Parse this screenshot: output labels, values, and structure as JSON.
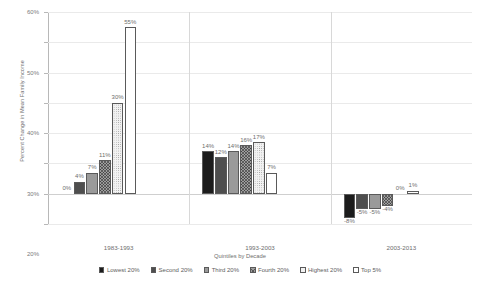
{
  "chart_data": {
    "type": "bar",
    "title": "",
    "xlabel": "Quintiles by Decade",
    "ylabel": "Percent Change in Mean Family Income",
    "ylim": [
      -10,
      60
    ],
    "ytick_labels": [
      "60%",
      "50%",
      "40%",
      "30%",
      "20%",
      "10%",
      "0%",
      "-10%"
    ],
    "ytick_values": [
      60,
      50,
      40,
      30,
      20,
      10,
      0,
      -10
    ],
    "grid": true,
    "legend_position": "bottom",
    "categories": [
      "1983-1993",
      "1993-2003",
      "2003-2013"
    ],
    "series": [
      {
        "name": "Lowest 20%",
        "pattern": "p-solid-dark",
        "values": [
          0,
          14,
          -8
        ],
        "labels": [
          "0%",
          "14%",
          "-8%"
        ]
      },
      {
        "name": "Second 20%",
        "pattern": "p-dark-gray",
        "values": [
          4,
          12,
          -5
        ],
        "labels": [
          "4%",
          "12%",
          "-5%"
        ]
      },
      {
        "name": "Third 20%",
        "pattern": "p-mid-gray",
        "values": [
          7,
          14,
          -5
        ],
        "labels": [
          "7%",
          "14%",
          "-5%"
        ]
      },
      {
        "name": "Fourth 20%",
        "pattern": "p-hatch",
        "values": [
          11,
          16,
          -4
        ],
        "labels": [
          "11%",
          "16%",
          "-4%"
        ]
      },
      {
        "name": "Highest 20%",
        "pattern": "p-dots",
        "values": [
          30,
          17,
          0
        ],
        "labels": [
          "30%",
          "17%",
          "0%"
        ]
      },
      {
        "name": "Top 5%",
        "pattern": "p-white",
        "values": [
          55,
          7,
          1
        ],
        "labels": [
          "55%",
          "7%",
          "1%"
        ]
      }
    ]
  },
  "axis": {
    "y_title": "Percent Change in Mean Family Income",
    "x_title": "Quintiles by Decade"
  },
  "colors": {
    "gridline": "#eaeaea",
    "axis": "#b8b8b8",
    "text": "#6e6e6e",
    "bar_border": "#5a5a5a"
  }
}
